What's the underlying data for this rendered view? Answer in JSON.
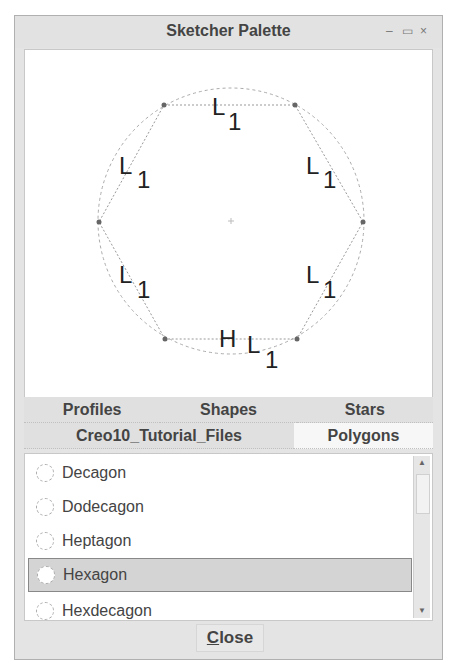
{
  "window": {
    "title": "Sketcher Palette",
    "controls": {
      "minimize": "–",
      "maximize": "▭",
      "close": "×"
    }
  },
  "preview": {
    "shape": "Hexagon",
    "labels": {
      "side": "L",
      "sub": "1",
      "horizontal": "H"
    }
  },
  "tabs": {
    "row1": [
      {
        "label": "Profiles"
      },
      {
        "label": "Shapes"
      },
      {
        "label": "Stars"
      }
    ],
    "row2": [
      {
        "label": "Creo10_Tutorial_Files"
      },
      {
        "label": "Polygons",
        "active": true
      }
    ]
  },
  "list": {
    "items": [
      {
        "label": "Decagon"
      },
      {
        "label": "Dodecagon"
      },
      {
        "label": "Heptagon"
      },
      {
        "label": "Hexagon",
        "selected": true
      },
      {
        "label": "Hexdecagon"
      }
    ],
    "scroll": {
      "up": "▲",
      "down": "▼"
    }
  },
  "footer": {
    "close_mnemonic": "C",
    "close_rest": "lose"
  }
}
